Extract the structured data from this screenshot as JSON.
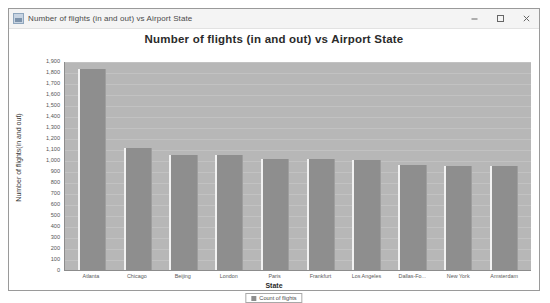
{
  "window": {
    "title": "Number of flights (in and out) vs Airport State",
    "icon": "chart-window-icon",
    "controls": {
      "minimize": "minimize-icon",
      "maximize": "maximize-icon",
      "close": "close-icon"
    }
  },
  "chart_data": {
    "type": "bar",
    "title": "Number of flights (in and out) vs Airport State",
    "xlabel": "State",
    "ylabel": "Number of flights(in and out)",
    "ylim": [
      0,
      1900
    ],
    "ytick_step": 100,
    "grid": true,
    "legend_position": "bottom",
    "legend": [
      "Count of flights"
    ],
    "series_name": "Count of flights",
    "categories": [
      "Atlanta",
      "Chicago",
      "Beijing",
      "London",
      "Paris",
      "Frankfurt",
      "Los Angeles",
      "Dallas-Fo...",
      "New York",
      "Amsterdam"
    ],
    "values": [
      1830,
      1110,
      1050,
      1050,
      1010,
      1005,
      1000,
      955,
      950,
      945
    ],
    "ytick_labels": [
      "1,900",
      "1,800",
      "1,700",
      "1,600",
      "1,500",
      "1,400",
      "1,300",
      "1,200",
      "1,100",
      "1,000",
      "900",
      "800",
      "700",
      "600",
      "500",
      "400",
      "300",
      "200",
      "100",
      "0"
    ]
  },
  "colors": {
    "bar_fill": "#8e8e8e",
    "plot_background": "#b7b7b7",
    "gridline": "#c2c2c2",
    "window_background": "#f0f0f0"
  }
}
